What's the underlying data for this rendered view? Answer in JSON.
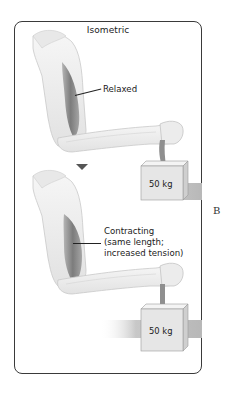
{
  "figure": {
    "title": "Isometric",
    "side_letter": "B",
    "panels": [
      {
        "state": "relaxed",
        "muscle_label": "Relaxed",
        "weight_label": "50 kg"
      },
      {
        "state": "contracting",
        "muscle_label_lines": [
          "Contracting",
          "(same length;",
          "increased tension)"
        ],
        "weight_label": "50 kg"
      }
    ],
    "colors": {
      "border": "#3a3a3a",
      "skin": "#eeeeee",
      "muscle": "#8a8a8a",
      "floor": "#bdbdbd",
      "box_front": "#e8e8e8",
      "box_top": "#f5f5f5",
      "box_side": "#d0d0d0"
    }
  }
}
